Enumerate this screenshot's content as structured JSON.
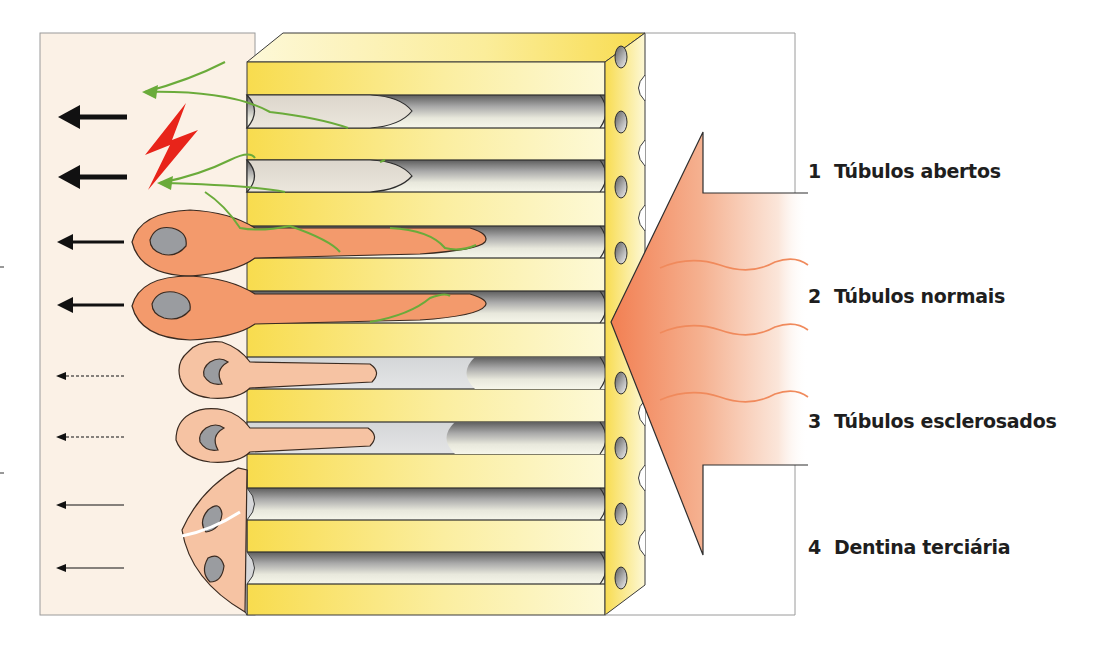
{
  "figure": {
    "type": "dentin-tubule-response-diagram",
    "colors": {
      "pulp_background": "#fbf1e6",
      "dentin_yellow": "#f8de5a",
      "dentin_light": "#fdf8d2",
      "tubule_gray": "#8d8d8d",
      "odontoblast_active": "#f39a6c",
      "odontoblast_inactive": "#f6c3a3",
      "nerve_green": "#6aab3a",
      "pain_red": "#e8241a",
      "stimulus_orange": "#f38a5e",
      "outline": "#3a3a3a"
    },
    "tubule_rows": [
      {
        "index": 1,
        "state": "open",
        "contents": "nerve-fiber"
      },
      {
        "index": 2,
        "state": "open",
        "contents": "nerve-fiber"
      },
      {
        "index": 3,
        "state": "normal",
        "contents": "odontoblast-process"
      },
      {
        "index": 4,
        "state": "normal",
        "contents": "odontoblast-process"
      },
      {
        "index": 5,
        "state": "sclerosed",
        "contents": "odontoblast-process"
      },
      {
        "index": 6,
        "state": "sclerosed",
        "contents": "odontoblast-process"
      },
      {
        "index": 7,
        "state": "tertiary-dentin",
        "contents": "none"
      },
      {
        "index": 8,
        "state": "tertiary-dentin",
        "contents": "none"
      }
    ],
    "left_arrows": [
      {
        "row": 1,
        "style": "bold"
      },
      {
        "row": 2,
        "style": "bold"
      },
      {
        "row": 3,
        "style": "medium"
      },
      {
        "row": 4,
        "style": "medium"
      },
      {
        "row": 5,
        "style": "dotted"
      },
      {
        "row": 6,
        "style": "dotted"
      },
      {
        "row": 7,
        "style": "thin"
      },
      {
        "row": 8,
        "style": "thin"
      }
    ]
  },
  "labels": [
    {
      "number": "1",
      "text": "Túbulos abertos"
    },
    {
      "number": "2",
      "text": "Túbulos normais"
    },
    {
      "number": "3",
      "text": "Túbulos esclerosados"
    },
    {
      "number": "4",
      "text": "Dentina terciária"
    }
  ]
}
